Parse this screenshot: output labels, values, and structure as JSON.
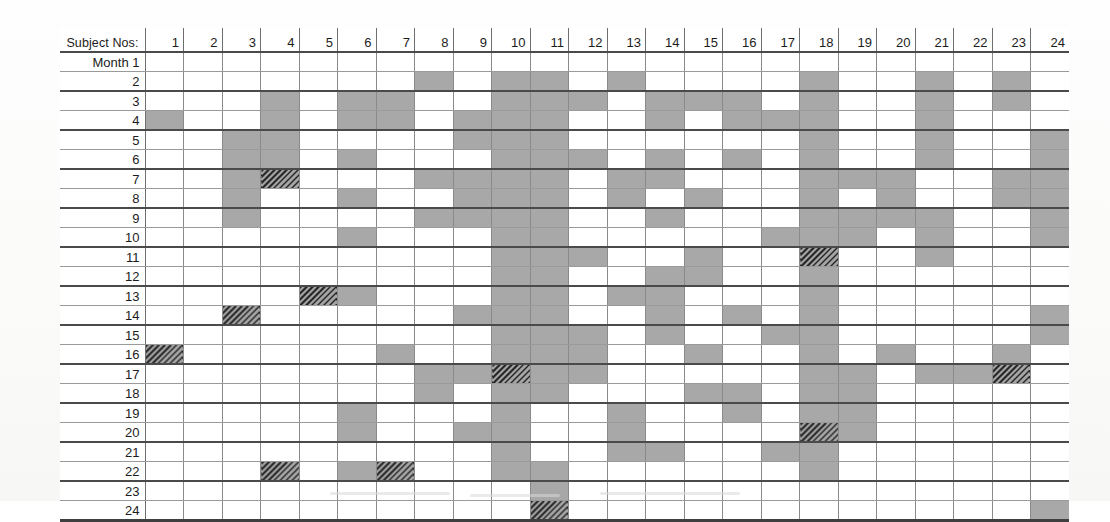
{
  "chart_data": {
    "type": "heatmap",
    "title": "",
    "xlabel": "Subject Nos:",
    "ylabel": "Month",
    "legend": [
      {
        "key": "empty",
        "label": "no event",
        "color": "#ffffff"
      },
      {
        "key": "shaded",
        "label": "shaded",
        "color": "#a8a8a8"
      },
      {
        "key": "hatched",
        "label": "hatched",
        "color": "#757575"
      }
    ],
    "grid": true,
    "x_tick_labels": [
      "1",
      "2",
      "3",
      "4",
      "5",
      "6",
      "7",
      "8",
      "9",
      "10",
      "11",
      "12",
      "13",
      "14",
      "15",
      "16",
      "17",
      "18",
      "19",
      "20",
      "21",
      "22",
      "23",
      "24"
    ],
    "y_tick_labels": [
      "Month 1",
      "2",
      "3",
      "4",
      "5",
      "6",
      "7",
      "8",
      "9",
      "10",
      "11",
      "12",
      "13",
      "14",
      "15",
      "16",
      "17",
      "18",
      "19",
      "20",
      "21",
      "22",
      "23",
      "24"
    ],
    "value_legend": {
      "0": "empty",
      "1": "shaded",
      "2": "hatched"
    },
    "values": [
      [
        0,
        0,
        0,
        0,
        0,
        0,
        0,
        0,
        0,
        0,
        0,
        0,
        0,
        0,
        0,
        0,
        0,
        0,
        0,
        0,
        0,
        0,
        0,
        0
      ],
      [
        0,
        0,
        0,
        0,
        0,
        0,
        0,
        1,
        0,
        1,
        1,
        0,
        1,
        0,
        0,
        0,
        0,
        1,
        0,
        0,
        1,
        0,
        1,
        0
      ],
      [
        0,
        0,
        0,
        1,
        0,
        1,
        1,
        0,
        0,
        1,
        1,
        1,
        0,
        1,
        1,
        1,
        0,
        1,
        0,
        0,
        1,
        0,
        1,
        0
      ],
      [
        1,
        0,
        0,
        1,
        0,
        1,
        1,
        0,
        1,
        1,
        1,
        0,
        0,
        1,
        0,
        1,
        1,
        1,
        0,
        0,
        1,
        0,
        0,
        0
      ],
      [
        0,
        0,
        1,
        1,
        0,
        0,
        0,
        0,
        1,
        1,
        1,
        0,
        0,
        0,
        0,
        0,
        0,
        1,
        0,
        0,
        1,
        0,
        0,
        1
      ],
      [
        0,
        0,
        1,
        1,
        0,
        1,
        0,
        0,
        0,
        1,
        1,
        1,
        0,
        1,
        0,
        1,
        0,
        1,
        0,
        0,
        1,
        0,
        0,
        1
      ],
      [
        0,
        0,
        1,
        2,
        0,
        0,
        0,
        1,
        1,
        1,
        1,
        0,
        1,
        1,
        0,
        0,
        0,
        1,
        1,
        1,
        0,
        0,
        1,
        1
      ],
      [
        0,
        0,
        1,
        0,
        0,
        1,
        0,
        0,
        1,
        1,
        1,
        0,
        1,
        0,
        1,
        0,
        0,
        1,
        0,
        1,
        0,
        0,
        1,
        1
      ],
      [
        0,
        0,
        1,
        0,
        0,
        0,
        0,
        1,
        1,
        1,
        1,
        0,
        0,
        1,
        0,
        0,
        0,
        1,
        1,
        1,
        1,
        0,
        0,
        1
      ],
      [
        0,
        0,
        0,
        0,
        0,
        1,
        0,
        0,
        0,
        1,
        1,
        0,
        0,
        0,
        0,
        0,
        1,
        1,
        1,
        0,
        1,
        0,
        0,
        1
      ],
      [
        0,
        0,
        0,
        0,
        0,
        0,
        0,
        0,
        0,
        1,
        1,
        1,
        0,
        0,
        1,
        0,
        0,
        2,
        0,
        0,
        1,
        0,
        0,
        0
      ],
      [
        0,
        0,
        0,
        0,
        0,
        0,
        0,
        0,
        0,
        1,
        1,
        0,
        0,
        1,
        1,
        0,
        0,
        1,
        0,
        0,
        0,
        0,
        0,
        0
      ],
      [
        0,
        0,
        0,
        0,
        2,
        1,
        0,
        0,
        0,
        1,
        1,
        0,
        1,
        1,
        0,
        0,
        0,
        1,
        0,
        0,
        0,
        0,
        0,
        0
      ],
      [
        0,
        0,
        2,
        0,
        0,
        0,
        0,
        0,
        1,
        1,
        1,
        0,
        0,
        1,
        0,
        1,
        0,
        1,
        0,
        0,
        0,
        0,
        0,
        1
      ],
      [
        0,
        0,
        0,
        0,
        0,
        0,
        0,
        0,
        0,
        1,
        1,
        1,
        0,
        1,
        0,
        0,
        1,
        1,
        0,
        0,
        0,
        0,
        0,
        1
      ],
      [
        2,
        0,
        0,
        0,
        0,
        0,
        1,
        0,
        0,
        1,
        1,
        1,
        0,
        0,
        1,
        0,
        0,
        1,
        0,
        1,
        0,
        0,
        1,
        0
      ],
      [
        0,
        0,
        0,
        0,
        0,
        0,
        0,
        1,
        1,
        2,
        1,
        1,
        0,
        0,
        0,
        0,
        0,
        1,
        1,
        0,
        1,
        1,
        2,
        0
      ],
      [
        0,
        0,
        0,
        0,
        0,
        0,
        0,
        1,
        0,
        1,
        1,
        0,
        0,
        0,
        1,
        1,
        0,
        1,
        1,
        0,
        0,
        0,
        0,
        0
      ],
      [
        0,
        0,
        0,
        0,
        0,
        1,
        0,
        0,
        0,
        1,
        0,
        0,
        1,
        0,
        0,
        1,
        0,
        1,
        1,
        0,
        0,
        0,
        0,
        0
      ],
      [
        0,
        0,
        0,
        0,
        0,
        1,
        0,
        0,
        1,
        1,
        0,
        0,
        1,
        0,
        0,
        0,
        0,
        2,
        1,
        0,
        0,
        0,
        0,
        0
      ],
      [
        0,
        0,
        0,
        0,
        0,
        0,
        0,
        0,
        0,
        1,
        0,
        0,
        1,
        1,
        0,
        0,
        1,
        1,
        0,
        0,
        0,
        0,
        0,
        0
      ],
      [
        0,
        0,
        0,
        2,
        0,
        1,
        2,
        0,
        0,
        1,
        1,
        0,
        0,
        0,
        0,
        0,
        0,
        1,
        0,
        0,
        0,
        0,
        0,
        0
      ],
      [
        0,
        0,
        0,
        0,
        0,
        0,
        0,
        0,
        0,
        0,
        1,
        0,
        0,
        0,
        0,
        0,
        0,
        0,
        0,
        0,
        0,
        0,
        0,
        0
      ],
      [
        0,
        0,
        0,
        0,
        0,
        0,
        0,
        0,
        0,
        0,
        2,
        0,
        0,
        0,
        0,
        0,
        0,
        0,
        0,
        0,
        0,
        0,
        0,
        1
      ]
    ]
  },
  "header": {
    "corner_label": "Subject Nos:",
    "columns": [
      "1",
      "2",
      "3",
      "4",
      "5",
      "6",
      "7",
      "8",
      "9",
      "10",
      "11",
      "12",
      "13",
      "14",
      "15",
      "16",
      "17",
      "18",
      "19",
      "20",
      "21",
      "22",
      "23",
      "24"
    ]
  },
  "rows": [
    {
      "label": "Month 1"
    },
    {
      "label": "2"
    },
    {
      "label": "3"
    },
    {
      "label": "4"
    },
    {
      "label": "5"
    },
    {
      "label": "6"
    },
    {
      "label": "7"
    },
    {
      "label": "8"
    },
    {
      "label": "9"
    },
    {
      "label": "10"
    },
    {
      "label": "11"
    },
    {
      "label": "12"
    },
    {
      "label": "13"
    },
    {
      "label": "14"
    },
    {
      "label": "15"
    },
    {
      "label": "16"
    },
    {
      "label": "17"
    },
    {
      "label": "18"
    },
    {
      "label": "19"
    },
    {
      "label": "20"
    },
    {
      "label": "21"
    },
    {
      "label": "22"
    },
    {
      "label": "23"
    },
    {
      "label": "24"
    }
  ],
  "colors": {
    "shaded": "#a8a8a8",
    "hatched": "#757575",
    "empty": "#ffffff",
    "rule_thick": "#4a4a4a",
    "rule_thin": "#9a9a9a",
    "text": "#1c1c1c"
  }
}
